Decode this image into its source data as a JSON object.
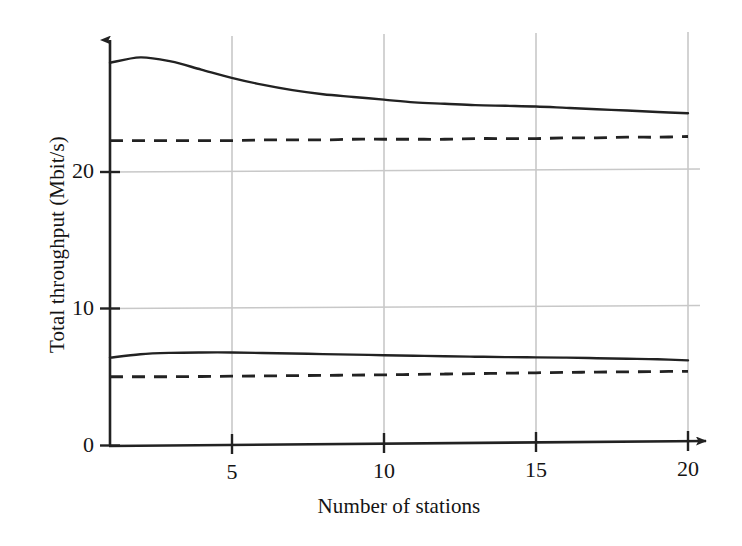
{
  "figure": {
    "background_color": "#ffffff",
    "ink_color": "#222222",
    "grid_color": "#c8c8c8"
  },
  "chart_data": {
    "type": "line",
    "title": "",
    "xlabel": "Number of stations",
    "ylabel": "Total throughput (Mbit/s)",
    "xlim": [
      1,
      20
    ],
    "ylim": [
      0,
      29.5
    ],
    "xticks": [
      5,
      10,
      15,
      20
    ],
    "xtick_labels": [
      "5",
      "10",
      "15",
      "20"
    ],
    "yticks": [
      0,
      10,
      20
    ],
    "ytick_labels": [
      "0",
      "10",
      "20"
    ],
    "grid": true,
    "grid_axes": "both",
    "legend": "none",
    "axis_arrows": true,
    "x": [
      1,
      2,
      3,
      4,
      5,
      6,
      7,
      8,
      9,
      10,
      11,
      12,
      13,
      14,
      15,
      16,
      17,
      18,
      19,
      20
    ],
    "series": [
      {
        "name": "upper-solid",
        "style": "solid",
        "color": "#222222",
        "values": [
          28.0,
          28.4,
          28.1,
          27.5,
          26.9,
          26.4,
          26.0,
          25.7,
          25.5,
          25.3,
          25.1,
          25.0,
          24.9,
          24.85,
          24.8,
          24.7,
          24.6,
          24.5,
          24.4,
          24.3
        ]
      },
      {
        "name": "upper-dashed",
        "style": "dashed",
        "color": "#222222",
        "values": [
          22.3,
          22.3,
          22.3,
          22.3,
          22.3,
          22.35,
          22.35,
          22.35,
          22.4,
          22.4,
          22.4,
          22.4,
          22.45,
          22.45,
          22.45,
          22.5,
          22.5,
          22.55,
          22.55,
          22.6
        ]
      },
      {
        "name": "lower-solid",
        "style": "solid",
        "color": "#222222",
        "values": [
          6.4,
          6.65,
          6.75,
          6.78,
          6.78,
          6.74,
          6.7,
          6.66,
          6.62,
          6.58,
          6.54,
          6.5,
          6.47,
          6.44,
          6.42,
          6.4,
          6.36,
          6.32,
          6.28,
          6.2
        ]
      },
      {
        "name": "lower-dashed",
        "style": "dashed",
        "color": "#222222",
        "values": [
          5.0,
          5.0,
          5.0,
          5.02,
          5.04,
          5.06,
          5.08,
          5.1,
          5.12,
          5.14,
          5.17,
          5.2,
          5.23,
          5.26,
          5.29,
          5.32,
          5.34,
          5.36,
          5.38,
          5.4
        ]
      }
    ]
  }
}
